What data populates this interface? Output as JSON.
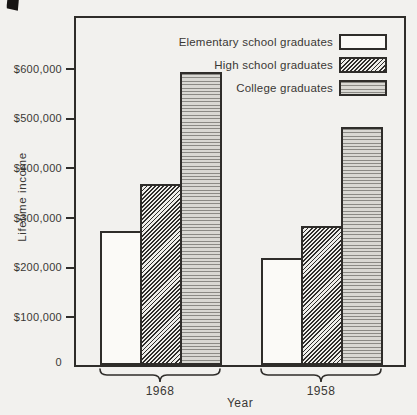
{
  "figure": {
    "paper_color": "#f2f1ee",
    "ink_color": "#2f2d2a",
    "college_fill_color": "#d9d8d3"
  },
  "chart_data": {
    "type": "bar",
    "title": "",
    "xlabel": "Year",
    "ylabel": "Lifetime income",
    "categories": [
      "1968",
      "1958"
    ],
    "series": [
      {
        "name": "Elementary school graduates",
        "pattern": "plain",
        "values": [
          270000,
          215000
        ]
      },
      {
        "name": "High school graduates",
        "pattern": "diagonal-hatch",
        "values": [
          365000,
          280000
        ]
      },
      {
        "name": "College graduates",
        "pattern": "horizontal-lines",
        "values": [
          590000,
          480000
        ]
      }
    ],
    "ylim": [
      0,
      600000
    ],
    "ytick_step": 100000,
    "ytick_labels": [
      "0",
      "$100,000",
      "$200,000",
      "$300,000",
      "$400,000",
      "$500,000",
      "$600,000"
    ],
    "legend_position": "top-right",
    "grid": false
  }
}
